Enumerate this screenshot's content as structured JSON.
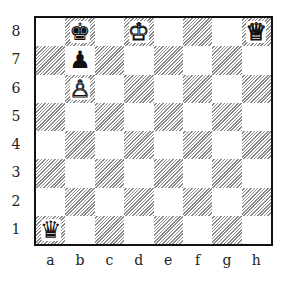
{
  "diagram": {
    "type": "chess-position",
    "ranks": [
      "8",
      "7",
      "6",
      "5",
      "4",
      "3",
      "2",
      "1"
    ],
    "files": [
      "a",
      "b",
      "c",
      "d",
      "e",
      "f",
      "g",
      "h"
    ],
    "pieces": [
      {
        "square": "b8",
        "color": "black",
        "type": "king",
        "glyph": "♚"
      },
      {
        "square": "d8",
        "color": "white",
        "type": "king",
        "glyph": "♔"
      },
      {
        "square": "h8",
        "color": "white",
        "type": "queen",
        "glyph": "♕"
      },
      {
        "square": "b7",
        "color": "black",
        "type": "pawn",
        "glyph": "♟"
      },
      {
        "square": "b6",
        "color": "white",
        "type": "pawn",
        "glyph": "♙"
      },
      {
        "square": "a1",
        "color": "black",
        "type": "queen",
        "glyph": "♛"
      }
    ]
  }
}
